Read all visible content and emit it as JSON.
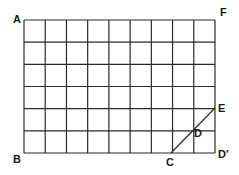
{
  "diagram": {
    "type": "grid",
    "columns": 9,
    "rows": 6,
    "grid": {
      "left": 24,
      "top": 20,
      "right": 215,
      "bottom": 153
    },
    "line_color": "#2a2a2a",
    "labels": {
      "A": "A",
      "B": "B",
      "C": "C",
      "D": "D",
      "D_prime": "D′",
      "E": "E",
      "F": "F"
    },
    "points": {
      "A": [
        24,
        20
      ],
      "B": [
        24,
        153
      ],
      "C": [
        171,
        153
      ],
      "D": [
        193,
        131
      ],
      "D_prime": [
        215,
        153
      ],
      "E": [
        215,
        108
      ],
      "F": [
        215,
        20
      ]
    },
    "diagonal": {
      "from": "C",
      "to": "E",
      "through": "D"
    }
  }
}
